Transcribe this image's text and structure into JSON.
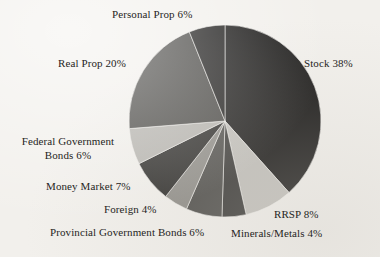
{
  "figure": {
    "background_color": "#f2f0ec",
    "text_color": "#262523"
  },
  "chart_data": {
    "type": "pie",
    "title": "",
    "xlabel": "",
    "ylabel": "",
    "legend_position": "none",
    "grid": false,
    "labels_outside": true,
    "start_angle_clock_position": "12 o'clock",
    "direction": "clockwise",
    "categories": [
      "Stock",
      "RRSP",
      "Minerals/Metals",
      "Provincial Government Bonds",
      "Foreign",
      "Money Market",
      "Federal Government Bonds",
      "Real Prop",
      "Personal Prop"
    ],
    "values": [
      38,
      8,
      4,
      6,
      4,
      7,
      6,
      20,
      6
    ],
    "value_unit": "%",
    "total": 99,
    "colors": [
      "#1c1b1a",
      "#c2c0bb",
      "#3a3937",
      "#4e4d4a",
      "#8e8c87",
      "#2b2a28",
      "#b6b4af",
      "#4a4946",
      "#201f1e"
    ],
    "slices": [
      {
        "name": "Stock",
        "value": 38,
        "label": "Stock 38%",
        "color": "#1c1b1a"
      },
      {
        "name": "RRSP",
        "value": 8,
        "label": "RRSP 8%",
        "color": "#c2c0bb"
      },
      {
        "name": "Minerals/Metals",
        "value": 4,
        "label": "Minerals/Metals 4%",
        "color": "#3a3937"
      },
      {
        "name": "Provincial Government Bonds",
        "value": 6,
        "label": "Provincial Government Bonds 6%",
        "color": "#4e4d4a"
      },
      {
        "name": "Foreign",
        "value": 4,
        "label": "Foreign 4%",
        "color": "#8e8c87"
      },
      {
        "name": "Money Market",
        "value": 7,
        "label": "Money Market 7%",
        "color": "#2b2a28"
      },
      {
        "name": "Federal Government Bonds",
        "value": 6,
        "label": "Federal Government Bonds 6%",
        "color": "#b6b4af"
      },
      {
        "name": "Real Prop",
        "value": 20,
        "label": "Real Prop 20%",
        "color": "#4a4946"
      },
      {
        "name": "Personal Prop",
        "value": 6,
        "label": "Personal Prop 6%",
        "color": "#201f1e"
      }
    ],
    "geometry": {
      "center_x": 225,
      "center_y": 121,
      "radius": 96
    }
  },
  "labels": {
    "personal_prop": "Personal Prop 6%",
    "stock": "Stock 38%",
    "real_prop": "Real Prop 20%",
    "federal_bonds_line1": "Federal Government",
    "federal_bonds_line2": "Bonds 6%",
    "money_market": "Money Market 7%",
    "foreign": "Foreign 4%",
    "provincial_bonds": "Provincial Government Bonds 6%",
    "rrsp": "RRSP 8%",
    "minerals_metals": "Minerals/Metals 4%"
  }
}
